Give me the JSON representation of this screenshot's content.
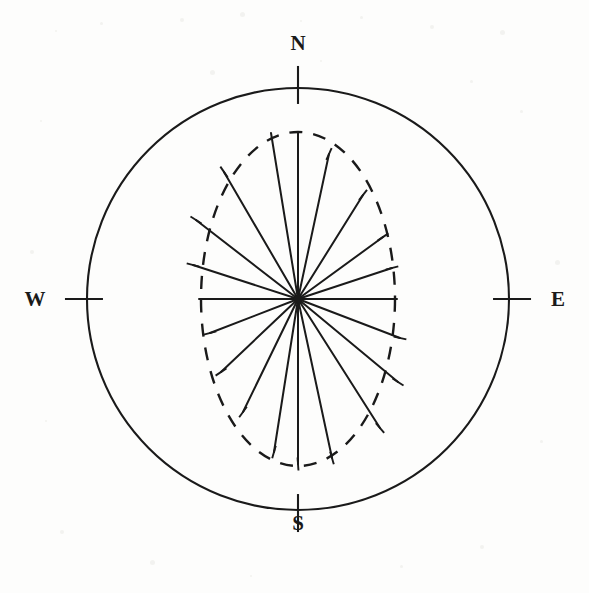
{
  "figure": {
    "kind": "rose-diagram",
    "title": "",
    "background_color": "#fdfdfc",
    "stroke_color": "#1a1a1a"
  },
  "cardinals": {
    "north": "N",
    "south": "S",
    "west": "W",
    "east": "E"
  },
  "chart_data": {
    "type": "line",
    "subtype": "rose-diagram-spokes",
    "title": "",
    "subtitle": "",
    "xlabel": "",
    "ylabel": "",
    "grid": false,
    "legend_position": "none",
    "annotations": [
      "N",
      "E",
      "S",
      "W"
    ],
    "geometry": {
      "center": {
        "x": 298,
        "y": 299
      },
      "outer_circle_radius": 211,
      "outer_circle_style": "solid",
      "tick_length": 38,
      "tick_directions": [
        "N",
        "E",
        "S",
        "W"
      ],
      "envelope_ellipse": {
        "rx": 97,
        "ry": 167,
        "style": "dashed",
        "dash_pattern": "13,11"
      }
    },
    "axis_ranges": {
      "azimuth_deg": [
        0,
        360
      ],
      "radius_normalized": [
        0,
        1
      ]
    },
    "tick_labels": [
      "N",
      "E",
      "S",
      "W"
    ],
    "spoke_count": 20,
    "spoke_azimuth_step_deg": 18,
    "spokes": [
      {
        "label": "N",
        "azimuth_deg": 0,
        "radius_norm": 1.0,
        "end_x": 298,
        "end_y": 132
      },
      {
        "label": "NNE-a",
        "azimuth_deg": 18,
        "radius_norm": 0.88,
        "end_x": 329,
        "end_y": 154
      },
      {
        "label": "NNE-b",
        "azimuth_deg": 36,
        "radius_norm": 0.76,
        "end_x": 363,
        "end_y": 195
      },
      {
        "label": "ENE-a",
        "azimuth_deg": 54,
        "radius_norm": 0.86,
        "end_x": 383,
        "end_y": 237
      },
      {
        "label": "ENE-b",
        "azimuth_deg": 72,
        "radius_norm": 0.96,
        "end_x": 392,
        "end_y": 268
      },
      {
        "label": "E",
        "azimuth_deg": 90,
        "radius_norm": 1.0,
        "end_x": 397,
        "end_y": 299
      },
      {
        "label": "ESE-a",
        "azimuth_deg": 108,
        "radius_norm": 1.0,
        "end_x": 400,
        "end_y": 338
      },
      {
        "label": "ESE-b",
        "azimuth_deg": 126,
        "radius_norm": 0.95,
        "end_x": 398,
        "end_y": 382
      },
      {
        "label": "SSE-a",
        "azimuth_deg": 144,
        "radius_norm": 0.86,
        "end_x": 380,
        "end_y": 428
      },
      {
        "label": "SSE-b",
        "azimuth_deg": 162,
        "radius_norm": 0.94,
        "end_x": 332,
        "end_y": 458
      },
      {
        "label": "S",
        "azimuth_deg": 180,
        "radius_norm": 0.98,
        "end_x": 298,
        "end_y": 464
      },
      {
        "label": "SSW-a",
        "azimuth_deg": 198,
        "radius_norm": 0.93,
        "end_x": 274,
        "end_y": 452
      },
      {
        "label": "SSW-b",
        "azimuth_deg": 216,
        "radius_norm": 0.73,
        "end_x": 243,
        "end_y": 412
      },
      {
        "label": "WSW-a",
        "azimuth_deg": 234,
        "radius_norm": 0.87,
        "end_x": 221,
        "end_y": 372
      },
      {
        "label": "WSW-b",
        "azimuth_deg": 252,
        "radius_norm": 0.93,
        "end_x": 210,
        "end_y": 333
      },
      {
        "label": "W",
        "azimuth_deg": 270,
        "radius_norm": 1.0,
        "end_x": 199,
        "end_y": 299
      },
      {
        "label": "WNW-a",
        "azimuth_deg": 288,
        "radius_norm": 0.96,
        "end_x": 193,
        "end_y": 265
      },
      {
        "label": "WNW-b",
        "azimuth_deg": 306,
        "radius_norm": 0.92,
        "end_x": 196,
        "end_y": 220
      },
      {
        "label": "NNW-a",
        "azimuth_deg": 324,
        "radius_norm": 0.84,
        "end_x": 224,
        "end_y": 172
      },
      {
        "label": "NNW-b",
        "azimuth_deg": 342,
        "radius_norm": 1.0,
        "end_x": 271,
        "end_y": 133
      }
    ],
    "crossbars": [
      {
        "x": 329,
        "y": 154,
        "angle_deg": -66
      },
      {
        "x": 363,
        "y": 195,
        "angle_deg": -52
      },
      {
        "x": 383,
        "y": 237,
        "angle_deg": -34
      },
      {
        "x": 392,
        "y": 268,
        "angle_deg": -14
      },
      {
        "x": 400,
        "y": 338,
        "angle_deg": 12
      },
      {
        "x": 398,
        "y": 382,
        "angle_deg": 32
      },
      {
        "x": 380,
        "y": 428,
        "angle_deg": 50
      },
      {
        "x": 332,
        "y": 458,
        "angle_deg": 74
      },
      {
        "x": 274,
        "y": 452,
        "angle_deg": -74
      },
      {
        "x": 243,
        "y": 412,
        "angle_deg": -54
      },
      {
        "x": 221,
        "y": 372,
        "angle_deg": -34
      },
      {
        "x": 210,
        "y": 333,
        "angle_deg": -14
      },
      {
        "x": 193,
        "y": 265,
        "angle_deg": 14
      },
      {
        "x": 196,
        "y": 220,
        "angle_deg": 32
      },
      {
        "x": 224,
        "y": 172,
        "angle_deg": 56
      },
      {
        "x": 298,
        "y": 464,
        "angle_deg": 86
      }
    ]
  }
}
